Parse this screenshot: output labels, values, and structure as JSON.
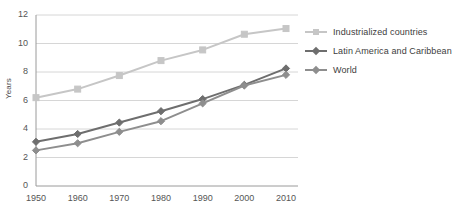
{
  "chart_data": {
    "type": "line",
    "title": "",
    "xlabel": "",
    "ylabel": "Years",
    "x": [
      1950,
      1960,
      1970,
      1980,
      1990,
      2000,
      2010
    ],
    "xticklabels": [
      "1950",
      "1960",
      "1970",
      "1980",
      "1990",
      "2000",
      "2010"
    ],
    "yticklabels": [
      "0",
      "2",
      "4",
      "6",
      "8",
      "10",
      "12"
    ],
    "yticks": [
      0,
      2,
      4,
      6,
      8,
      10,
      12
    ],
    "ylim": [
      0,
      12
    ],
    "grid": "horizontal",
    "legend_position": "right",
    "series": [
      {
        "name": "Industrialized countries",
        "color": "#c6c6c6",
        "marker": "square",
        "values": [
          6.2,
          6.8,
          7.75,
          8.8,
          9.55,
          10.65,
          11.05
        ]
      },
      {
        "name": "Latin America and Caribbean",
        "color": "#6e6e6e",
        "marker": "diamond",
        "values": [
          3.1,
          3.65,
          4.45,
          5.25,
          6.1,
          7.1,
          8.25
        ]
      },
      {
        "name": "World",
        "color": "#8e8e8e",
        "marker": "diamond",
        "values": [
          2.5,
          3.0,
          3.8,
          4.55,
          5.8,
          7.05,
          7.8
        ]
      }
    ]
  },
  "axes": {
    "axis_color": "#9a9a9a",
    "grid_color": "#d6d6d6",
    "tick_text_color": "#555555"
  },
  "plot_geometry": {
    "left": 36,
    "right": 286,
    "top": 15,
    "bottom": 186
  }
}
